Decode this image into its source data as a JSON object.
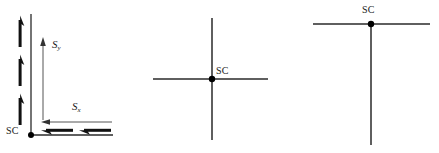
{
  "figure": {
    "title": "",
    "background_color": "#ffffff",
    "line_color": "#2a2a2a",
    "bold_arrow_color": "#111111",
    "width": 439,
    "height": 153
  },
  "panels": [
    {
      "id": "left",
      "name": "corner-axes-with-field-arrows",
      "origin_label": "SC",
      "axis_labels": {
        "vertical": "S",
        "vertical_sub": "y",
        "horizontal": "S",
        "horizontal_sub": "x"
      },
      "vertical_axis": {
        "x": 31,
        "y_top": 14,
        "y_bottom": 135
      },
      "horizontal_axis": {
        "y": 135,
        "x_left": 31,
        "x_right": 113
      },
      "origin_dot": {
        "x": 31,
        "y": 135,
        "r": 3
      },
      "thin_arrow_vertical": {
        "x": 43,
        "y_tail": 120,
        "y_head": 40,
        "direction": "up"
      },
      "thin_arrow_horizontal": {
        "y": 122,
        "x_tail": 112,
        "x_head": 42,
        "direction": "left"
      },
      "bold_arrows_vertical": [
        {
          "x": 20,
          "y_tail": 47,
          "y_head": 18,
          "direction": "up"
        },
        {
          "x": 20,
          "y_tail": 86,
          "y_head": 57,
          "direction": "up"
        },
        {
          "x": 20,
          "y_tail": 125,
          "y_head": 96,
          "direction": "up"
        }
      ],
      "bold_arrows_horizontal": [
        {
          "y": 130,
          "x_tail": 73,
          "x_head": 41,
          "direction": "left"
        },
        {
          "y": 130,
          "x_tail": 111,
          "x_head": 79,
          "direction": "left"
        }
      ]
    },
    {
      "id": "middle",
      "name": "cross-axes",
      "origin_label": "SC",
      "vertical_line": {
        "x": 212,
        "y_top": 18,
        "y_bottom": 140
      },
      "horizontal_line": {
        "y": 79,
        "x_left": 153,
        "x_right": 268
      },
      "origin_dot": {
        "x": 212,
        "y": 79,
        "r": 3
      }
    },
    {
      "id": "right",
      "name": "inverted-t-axes",
      "origin_label": "SC",
      "horizontal_line": {
        "y": 24,
        "x_left": 313,
        "x_right": 430
      },
      "vertical_line": {
        "x": 371,
        "y_top": 24,
        "y_bottom": 145
      },
      "origin_dot": {
        "x": 371,
        "y": 24,
        "r": 3
      }
    }
  ],
  "labels": {
    "sc_left": "SC",
    "sc_middle": "SC",
    "sc_right": "SC",
    "s_y_base": "S",
    "s_y_sub": "y",
    "s_x_base": "S",
    "s_x_sub": "x"
  }
}
